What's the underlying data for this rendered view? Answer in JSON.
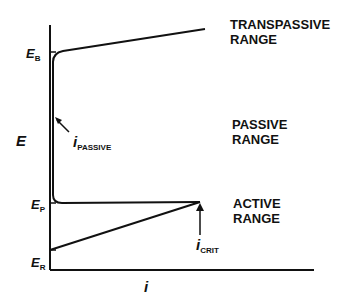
{
  "diagram": {
    "title": "",
    "axes": {
      "y_label": "E",
      "x_label": "i"
    },
    "potential_markers": [
      {
        "symbol": "E",
        "subscript": "B"
      },
      {
        "symbol": "E",
        "subscript": "P"
      },
      {
        "symbol": "E",
        "subscript": "R"
      }
    ],
    "current_markers": [
      {
        "symbol": "i",
        "subscript": "PASSIVE"
      },
      {
        "symbol": "i",
        "subscript": "CRIT"
      }
    ],
    "regions": [
      {
        "line1": "TRANSPASSIVE",
        "line2": "RANGE"
      },
      {
        "line1": "PASSIVE",
        "line2": "RANGE"
      },
      {
        "line1": "ACTIVE",
        "line2": "RANGE"
      }
    ],
    "colors": {
      "line": "#111111",
      "background": "#ffffff"
    }
  }
}
